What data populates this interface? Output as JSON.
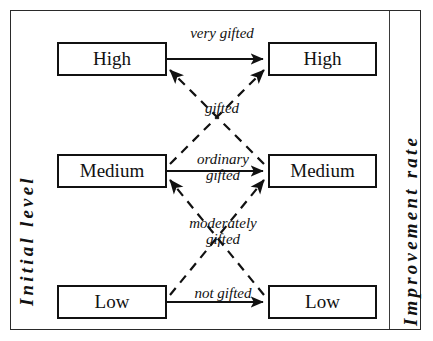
{
  "diagram": {
    "axes": {
      "left_caption": "Initial level",
      "right_caption": "Improvement rate"
    },
    "left_column": {
      "name": "Initial level",
      "nodes": [
        {
          "id": "left-high",
          "label": "High"
        },
        {
          "id": "left-medium",
          "label": "Medium"
        },
        {
          "id": "left-low",
          "label": "Low"
        }
      ]
    },
    "right_column": {
      "name": "Improvement rate",
      "nodes": [
        {
          "id": "right-high",
          "label": "High"
        },
        {
          "id": "right-medium",
          "label": "Medium"
        },
        {
          "id": "right-low",
          "label": "Low"
        }
      ]
    },
    "edges": [
      {
        "id": "edge-very-gifted",
        "from": "left-high",
        "to": "right-high",
        "style": "solid",
        "label": "very gifted",
        "label_lines": [
          "very gifted"
        ]
      },
      {
        "id": "edge-gifted-up",
        "from": "left-medium",
        "to": "right-high",
        "style": "dashed",
        "label": "gifted",
        "label_lines": [
          "gifted"
        ]
      },
      {
        "id": "edge-gifted-down",
        "from": "right-medium",
        "to": "left-high",
        "style": "dashed",
        "label": "gifted",
        "label_lines": [
          "gifted"
        ]
      },
      {
        "id": "edge-ordinary-gifted",
        "from": "left-medium",
        "to": "right-medium",
        "style": "solid",
        "label": "ordinary gifted",
        "label_lines": [
          "ordinary",
          "gifted"
        ]
      },
      {
        "id": "edge-moderately-gifted-up",
        "from": "left-low",
        "to": "right-medium",
        "style": "dashed",
        "label": "moderately gifted",
        "label_lines": [
          "moderately",
          "gifted"
        ]
      },
      {
        "id": "edge-moderately-gifted-down",
        "from": "right-low",
        "to": "left-medium",
        "style": "dashed",
        "label": "moderately gifted",
        "label_lines": [
          "moderately",
          "gifted"
        ]
      },
      {
        "id": "edge-not-gifted",
        "from": "left-low",
        "to": "right-low",
        "style": "solid",
        "label": "not gifted",
        "label_lines": [
          "not gifted"
        ]
      }
    ],
    "labels": {
      "very_gifted": "very gifted",
      "gifted": "gifted",
      "ordinary_line1": "ordinary",
      "ordinary_line2": "gifted",
      "moderately_line1": "moderately",
      "moderately_line2": "gifted",
      "not_gifted": "not gifted"
    },
    "colors": {
      "stroke": "#111111",
      "frame": "#2a2a2a",
      "background": "#ffffff"
    }
  }
}
